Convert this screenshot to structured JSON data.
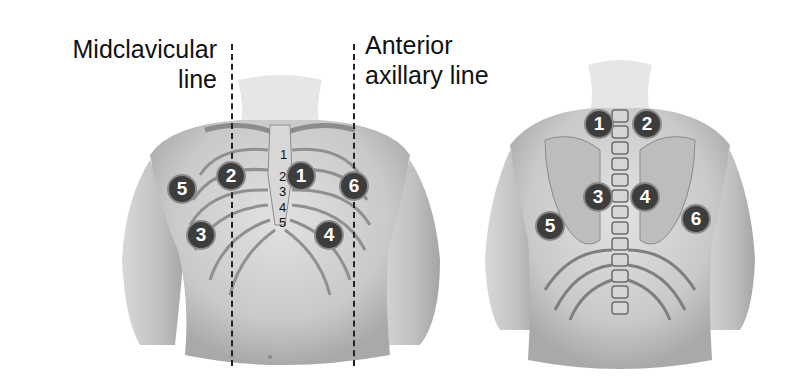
{
  "labels": {
    "midclavicular_line1": "Midclavicular",
    "midclavicular_line2": "line",
    "anterior_axillary_line1": "Anterior",
    "anterior_axillary_line2": "axillary line"
  },
  "anterior_view": {
    "badges": [
      "1",
      "2",
      "3",
      "4",
      "5",
      "6"
    ],
    "rib_numbers": [
      "1",
      "2",
      "3",
      "4",
      "5"
    ]
  },
  "posterior_view": {
    "badges": [
      "1",
      "2",
      "3",
      "4",
      "5",
      "6"
    ]
  },
  "colors": {
    "badge_fill": "#3d3d3d",
    "badge_ring": "#8a8a8a",
    "skin": "#cfcfcf",
    "line": "#222222"
  }
}
